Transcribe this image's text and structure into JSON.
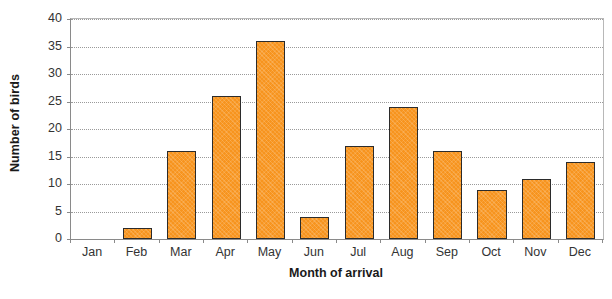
{
  "chart_data": {
    "type": "bar",
    "title": "",
    "categories": [
      "Jan",
      "Feb",
      "Mar",
      "Apr",
      "May",
      "Jun",
      "Jul",
      "Aug",
      "Sep",
      "Oct",
      "Nov",
      "Dec"
    ],
    "values": [
      0,
      2,
      16,
      26,
      36,
      4,
      17,
      24,
      16,
      9,
      11,
      14
    ],
    "xlabel": "Month of arrival",
    "ylabel": "Number of birds",
    "ylim": [
      0,
      40
    ],
    "yticks": [
      0,
      5,
      10,
      15,
      20,
      25,
      30,
      35,
      40
    ],
    "ytick_labels": [
      "0",
      "5",
      "10",
      "15",
      "20",
      "25",
      "30",
      "35",
      "40"
    ],
    "grid": true,
    "grid_axis": "y",
    "grid_style": "dotted",
    "legend": false,
    "bar_color": "#F7941E",
    "bar_edge_color": "#2B2B2B",
    "axis_color": "#8A8A8A",
    "background_color": "#FFFFFF"
  }
}
